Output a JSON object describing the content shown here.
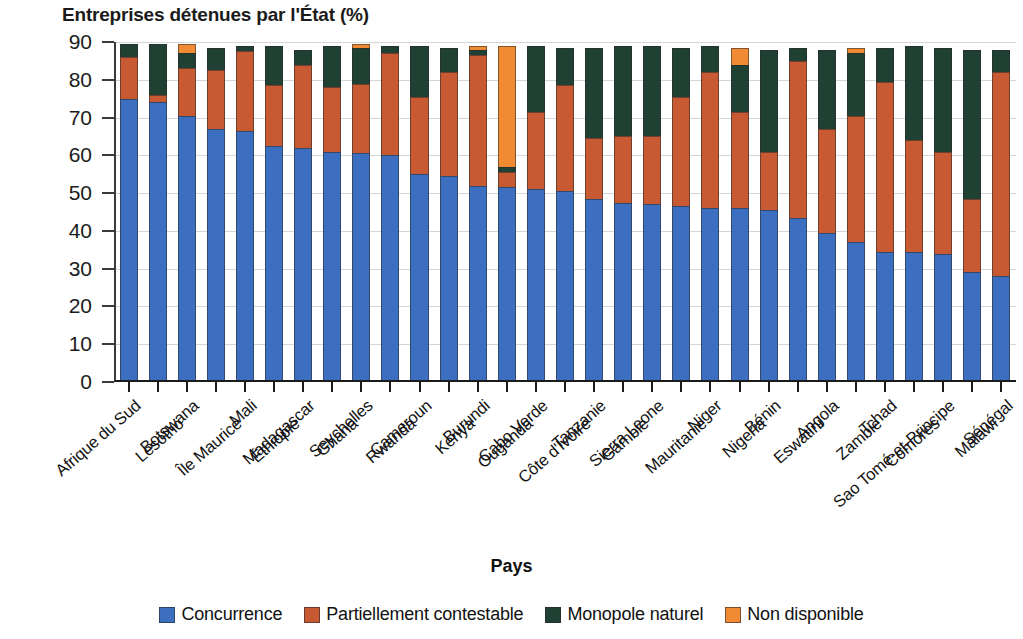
{
  "chart_data": {
    "type": "bar",
    "stacked": true,
    "title": "Entreprises détenues par l'État (%)",
    "xlabel": "Pays",
    "ylabel": "",
    "ylim": [
      0,
      90
    ],
    "ytick_step": 10,
    "yticks": [
      0,
      10,
      20,
      30,
      40,
      50,
      60,
      70,
      80,
      90
    ],
    "grid": true,
    "legend_position": "bottom",
    "categories": [
      "Afrique du Sud",
      "Lesotho",
      "Botswana",
      "Île Maurice",
      "Mali",
      "Éthiopie",
      "Madagascar",
      "Ghana",
      "Seychelles",
      "Rwanda",
      "Cameroun",
      "Kenya",
      "Burundi",
      "Ouganda",
      "Cabo Verde",
      "Côte d'Ivoire",
      "Tanzanie",
      "Gambie",
      "Sierra Leone",
      "Mauritanie",
      "Niger",
      "Nigeria",
      "Bénin",
      "Eswatini",
      "Angola",
      "Zambie",
      "Tchad",
      "Comores",
      "Sao Tomé-et-Principe",
      "Malawi",
      "Sénégal"
    ],
    "series": [
      {
        "name": "Concurrence",
        "color": "#3c6fc0",
        "values": [
          75,
          74,
          70.5,
          67,
          66.5,
          62.5,
          62,
          61,
          60.5,
          60,
          55,
          54.5,
          52,
          51.5,
          51,
          50.5,
          48.5,
          47.5,
          47,
          46.5,
          46,
          46,
          45.5,
          43.5,
          39.5,
          37,
          34.5,
          34.5,
          34,
          29,
          28
        ]
      },
      {
        "name": "Partiellement contestable",
        "color": "#c85a33",
        "values": [
          11,
          2,
          12.5,
          15.5,
          21,
          16,
          22,
          17,
          18.5,
          27,
          20.5,
          27.5,
          34.5,
          4,
          20.5,
          28,
          16,
          17.5,
          18,
          29,
          36,
          25.5,
          15.5,
          41.5,
          27.5,
          33.5,
          45,
          29.5,
          27,
          19.5,
          54
        ]
      },
      {
        "name": "Monopole naturel",
        "color": "#1f4032",
        "values": [
          3.5,
          13.5,
          4,
          6,
          1.5,
          10.5,
          4,
          11,
          9.5,
          2,
          13.5,
          6.5,
          1.5,
          1.5,
          17.5,
          10,
          24,
          24,
          24,
          13,
          7,
          12.5,
          27,
          3.5,
          21,
          16.5,
          9,
          25,
          27.5,
          39.5,
          6
        ]
      },
      {
        "name": "Non disponible",
        "color": "#f08a33",
        "values": [
          0,
          0,
          2.5,
          0,
          0,
          0,
          0,
          0,
          1,
          0,
          0,
          0,
          1,
          32,
          0,
          0,
          0,
          0,
          0,
          0,
          0,
          4.5,
          0,
          0,
          0,
          1.5,
          0,
          0,
          0,
          0,
          0
        ]
      }
    ]
  },
  "legend": {
    "items": [
      {
        "label": "Concurrence",
        "color": "#3c6fc0"
      },
      {
        "label": "Partiellement contestable",
        "color": "#c85a33"
      },
      {
        "label": "Monopole naturel",
        "color": "#1f4032"
      },
      {
        "label": "Non disponible",
        "color": "#f08a33"
      }
    ]
  }
}
